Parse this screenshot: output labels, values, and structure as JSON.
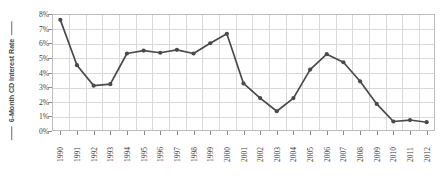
{
  "chart": {
    "type": "line",
    "ylabel": "6-Month CD Interest Rate",
    "xlabel": "",
    "title": "",
    "grid": true,
    "legend": "none"
  },
  "axis": {
    "y_ticks": [
      "0%",
      "1%",
      "2%",
      "3%",
      "4%",
      "5%",
      "6%",
      "7%",
      "8%"
    ],
    "y_min": 0,
    "y_max": 8
  },
  "chart_data": {
    "type": "line",
    "title": "",
    "xlabel": "",
    "ylabel": "6-Month CD Interest Rate",
    "ylim": [
      0,
      8
    ],
    "ytick_labels": [
      "0%",
      "1%",
      "2%",
      "3%",
      "4%",
      "5%",
      "6%",
      "7%",
      "8%"
    ],
    "ytick_values": [
      0,
      1,
      2,
      3,
      4,
      5,
      6,
      7,
      8
    ],
    "grid": true,
    "legend_position": "none",
    "marker": "circle",
    "line_color": "#4a4a4a",
    "categories": [
      "1990",
      "1991",
      "1992",
      "1993",
      "1994",
      "1995",
      "1996",
      "1997",
      "1998",
      "1999",
      "2000",
      "2001",
      "2002",
      "2003",
      "2004",
      "2005",
      "2006",
      "2007",
      "2008",
      "2009",
      "2010",
      "2011",
      "2012"
    ],
    "values": [
      7.6,
      4.5,
      3.1,
      3.2,
      5.3,
      5.5,
      5.35,
      5.55,
      5.3,
      6.0,
      6.65,
      3.25,
      2.25,
      1.35,
      2.25,
      4.2,
      5.25,
      4.7,
      3.4,
      1.85,
      0.65,
      0.75,
      0.6
    ],
    "series": [
      {
        "name": "6-Month CD Interest Rate",
        "values": [
          7.6,
          4.5,
          3.1,
          3.2,
          5.3,
          5.5,
          5.35,
          5.55,
          5.3,
          6.0,
          6.65,
          3.25,
          2.25,
          1.35,
          2.25,
          4.2,
          5.25,
          4.7,
          3.4,
          1.85,
          0.65,
          0.75,
          0.6
        ]
      }
    ]
  },
  "colors": {
    "line": "#4a4a4a",
    "marker": "#4a4a4a",
    "grid": "#d9d9d9",
    "frame": "#bdbdbd",
    "text": "#3d3d3d",
    "background": "#ffffff"
  }
}
